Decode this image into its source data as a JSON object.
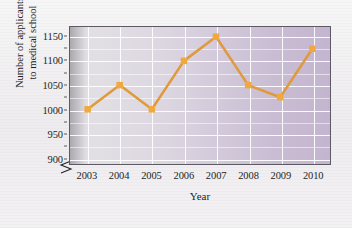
{
  "chart_data": {
    "type": "line",
    "title": "",
    "subtitle": "",
    "xlabel": "Year",
    "ylabel": "Number of applicants to medical school",
    "ylabel_lines": [
      "Number of applicants",
      "to medical school"
    ],
    "categories": [
      "2003",
      "2004",
      "2005",
      "2006",
      "2007",
      "2008",
      "2009",
      "2010"
    ],
    "x": [
      2003,
      2004,
      2005,
      2006,
      2007,
      2008,
      2009,
      2010
    ],
    "values": [
      1000,
      1050,
      1000,
      1100,
      1150,
      1050,
      1025,
      1125
    ],
    "series": [
      {
        "name": "Number of applicants to medical school",
        "values": [
          1000,
          1050,
          1000,
          1100,
          1150,
          1050,
          1025,
          1125
        ]
      }
    ],
    "ylim": [
      887,
      1170
    ],
    "xlim": [
      2002.45,
      2010.55
    ],
    "ytick_labels": [
      "900",
      "950",
      "1000",
      "1050",
      "1100",
      "1150"
    ],
    "ytick_values": [
      900,
      950,
      1000,
      1050,
      1100,
      1150
    ],
    "yminor_step": 25,
    "xtick_labels": [
      "2003",
      "2004",
      "2005",
      "2006",
      "2007",
      "2008",
      "2009",
      "2010"
    ],
    "grid": "on",
    "grid_color": "#ffffff",
    "legend": "none",
    "legend_position": "",
    "axis_break": true,
    "line_color": "#e09a3e",
    "marker_color": "#efa93f",
    "marker_shape": "square",
    "plot_bg_left": "#dcdade",
    "plot_bg_right": "#c3b5cf",
    "axis_color": "#5d5a63",
    "text_color": "#231f25"
  },
  "figure": {
    "background": "#f2f0f1"
  }
}
